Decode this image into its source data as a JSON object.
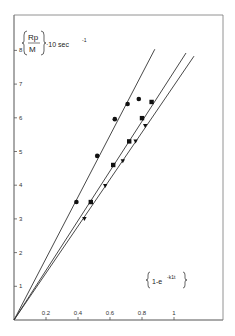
{
  "chart_data": {
    "type": "scatter",
    "title": "",
    "ylabel": {
      "numerator": "Rp",
      "denominator": "M",
      "suffix": "·10  sec",
      "exponent": "-1"
    },
    "xlabel": {
      "text": "1-e",
      "exponent": "-k1t"
    },
    "xlim": [
      0,
      1.3
    ],
    "ylim": [
      0,
      8.7
    ],
    "xticks": [
      0.2,
      0.4,
      0.6,
      0.8,
      1
    ],
    "xtick_labels": [
      "0.2",
      "0.4",
      "0.6",
      "0.8",
      "1"
    ],
    "yticks": [
      1,
      2,
      3,
      4,
      5,
      6,
      7,
      8
    ],
    "ytick_labels": [
      "1",
      "2",
      "3",
      "4",
      "5",
      "6",
      "7",
      "8"
    ],
    "grid": false,
    "series": [
      {
        "name": "circles",
        "marker": "circle",
        "points": [
          [
            0.39,
            3.5
          ],
          [
            0.52,
            4.87
          ],
          [
            0.63,
            5.96
          ],
          [
            0.71,
            6.41
          ],
          [
            0.78,
            6.56
          ]
        ],
        "fit_line": {
          "slope": 9.13,
          "intercept": 0,
          "x_end": 0.88
        }
      },
      {
        "name": "squares",
        "marker": "square",
        "points": [
          [
            0.48,
            3.5
          ],
          [
            0.62,
            4.6
          ],
          [
            0.72,
            5.3
          ],
          [
            0.8,
            5.99
          ],
          [
            0.86,
            6.47
          ]
        ],
        "fit_line": {
          "slope": 7.37,
          "intercept": 0,
          "x_end": 1.075
        }
      },
      {
        "name": "triangles",
        "marker": "triangle",
        "points": [
          [
            0.44,
            3.0
          ],
          [
            0.57,
            3.98
          ],
          [
            0.68,
            4.72
          ],
          [
            0.76,
            5.3
          ],
          [
            0.82,
            5.76
          ]
        ],
        "fit_line": {
          "slope": 6.96,
          "intercept": 0,
          "x_end": 1.125
        }
      }
    ]
  }
}
